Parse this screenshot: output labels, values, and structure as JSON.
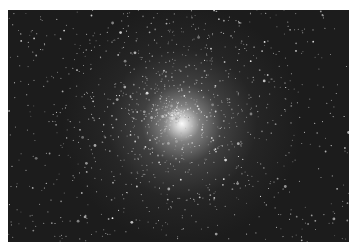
{
  "image": {
    "subject": "globular star cluster",
    "description": "Dense, roughly spherical cluster of stars on a black sky with a bright white core",
    "frame": {
      "x": 8,
      "y": 10,
      "width": 341,
      "height": 232
    },
    "colors": {
      "border": "#ffffff",
      "sky": "#1c1c1c",
      "core": "#ffffff",
      "stars": "#e6e6e6"
    },
    "core_center": {
      "x": 174,
      "y": 114
    },
    "star_field": {
      "count": 1400,
      "seed": 7,
      "core_radius": 110
    }
  }
}
